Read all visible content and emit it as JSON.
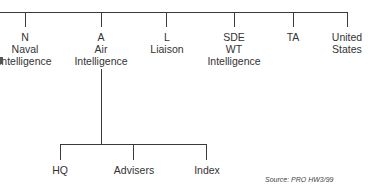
{
  "diagram": {
    "type": "org-chart",
    "top_level": [
      {
        "lines": [
          "N",
          "Naval",
          "Intelligence"
        ]
      },
      {
        "lines": [
          "A",
          "Air",
          "Intelligence"
        ]
      },
      {
        "lines": [
          "L",
          "Liaison"
        ]
      },
      {
        "lines": [
          "SDE",
          "WT",
          "Intelligence"
        ]
      },
      {
        "lines": [
          "TA"
        ]
      },
      {
        "lines": [
          "United",
          "States"
        ]
      }
    ],
    "air_intelligence_children": [
      {
        "label": "HQ"
      },
      {
        "label": "Advisers"
      },
      {
        "label": "Index"
      }
    ],
    "source": "Source: PRO HW3/99"
  }
}
